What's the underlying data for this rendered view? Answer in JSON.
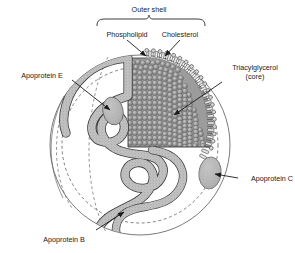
{
  "figure": {
    "background_color": "#ffffff",
    "ink_color": "#1a1a1a",
    "shell_fill": "#b0b0b0",
    "core_fill": "#8c8c8c",
    "apoprotein_fill": "#b8b8b8"
  },
  "bracket": {
    "label": "Outer shell"
  },
  "labels": {
    "phospholipid": "Phospholipid",
    "cholesterol": "Cholesterol",
    "triacylglycerol_line1": "Triacylglycerol",
    "triacylglycerol_line2": "(core)",
    "apoprotein_e": "Apoprotein E",
    "apoprotein_c": "Apoprotein C",
    "apoprotein_b": "Apoprotein B"
  }
}
